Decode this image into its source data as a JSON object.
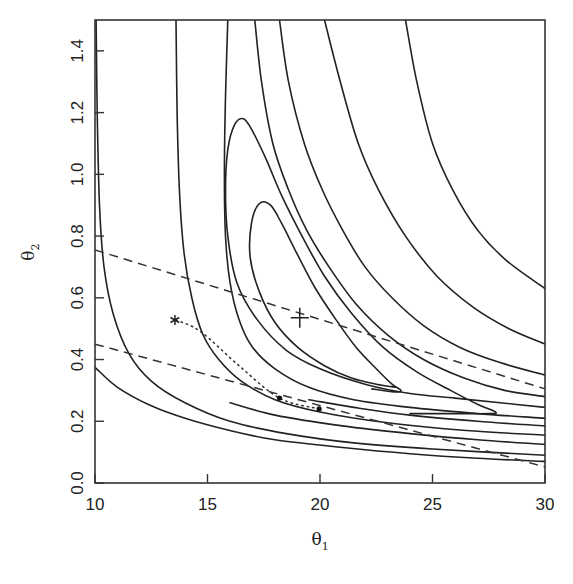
{
  "chart_data": {
    "type": "line",
    "subtype": "contour",
    "title": "",
    "xlabel": "θ",
    "xlabel_sub": "1",
    "ylabel": "θ",
    "ylabel_sub": "2",
    "xlim": [
      10,
      30
    ],
    "ylim": [
      0,
      1.5
    ],
    "xticks": [
      10,
      15,
      20,
      25,
      30
    ],
    "xtick_labels": [
      "10",
      "15",
      "20",
      "25",
      "30"
    ],
    "yticks": [
      0.0,
      0.2,
      0.4,
      0.6,
      0.8,
      1.0,
      1.2,
      1.4
    ],
    "ytick_labels": [
      "0.0",
      "0.2",
      "0.4",
      "0.6",
      "0.8",
      "1.0",
      "1.2",
      "1.4"
    ],
    "grid": false,
    "legend": "none",
    "contours": [
      {
        "name": "contour-1",
        "points": [
          [
            10.05,
            1.5
          ],
          [
            10.1,
            1.2
          ],
          [
            10.2,
            0.9
          ],
          [
            10.4,
            0.7
          ],
          [
            10.8,
            0.55
          ],
          [
            11.5,
            0.42
          ],
          [
            12.5,
            0.33
          ],
          [
            14,
            0.26
          ],
          [
            16,
            0.2
          ],
          [
            18.5,
            0.16
          ],
          [
            21.5,
            0.13
          ],
          [
            25,
            0.11
          ],
          [
            30,
            0.09
          ]
        ]
      },
      {
        "name": "contour-0",
        "points": [
          [
            10,
            0.375
          ],
          [
            11,
            0.31
          ],
          [
            12.5,
            0.25
          ],
          [
            14,
            0.21
          ],
          [
            16,
            0.17
          ],
          [
            18,
            0.14
          ],
          [
            21,
            0.115
          ],
          [
            24,
            0.095
          ],
          [
            27,
            0.08
          ],
          [
            30,
            0.07
          ]
        ]
      },
      {
        "name": "contour-2",
        "points": [
          [
            13.6,
            1.5
          ],
          [
            13.65,
            1.2
          ],
          [
            13.75,
            0.95
          ],
          [
            13.95,
            0.75
          ],
          [
            14.3,
            0.6
          ],
          [
            14.8,
            0.48
          ],
          [
            15.5,
            0.4
          ],
          [
            16.5,
            0.33
          ],
          [
            18,
            0.27
          ],
          [
            20,
            0.23
          ],
          [
            23,
            0.195
          ],
          [
            26.5,
            0.17
          ],
          [
            30,
            0.155
          ]
        ]
      },
      {
        "name": "contour-3",
        "points": [
          [
            15.9,
            1.5
          ],
          [
            15.8,
            1.25
          ],
          [
            15.75,
            1.0
          ],
          [
            15.8,
            0.8
          ],
          [
            16.0,
            0.65
          ],
          [
            16.4,
            0.53
          ],
          [
            17.0,
            0.44
          ],
          [
            18,
            0.37
          ],
          [
            19.5,
            0.31
          ],
          [
            21.5,
            0.27
          ],
          [
            24,
            0.245
          ],
          [
            27,
            0.225
          ],
          [
            30,
            0.21
          ]
        ]
      },
      {
        "name": "contour-4",
        "points": [
          [
            20.2,
            1.5
          ],
          [
            20.9,
            1.3
          ],
          [
            21.7,
            1.1
          ],
          [
            22.6,
            0.95
          ],
          [
            23.8,
            0.8
          ],
          [
            25.2,
            0.67
          ],
          [
            26.8,
            0.57
          ],
          [
            28.4,
            0.5
          ],
          [
            30,
            0.45
          ]
        ]
      },
      {
        "name": "contour-5",
        "points": [
          [
            23.8,
            1.5
          ],
          [
            24.3,
            1.3
          ],
          [
            25.0,
            1.1
          ],
          [
            25.9,
            0.95
          ],
          [
            27.0,
            0.82
          ],
          [
            28.3,
            0.72
          ],
          [
            30,
            0.63
          ]
        ]
      },
      {
        "name": "contour-6",
        "points": [
          [
            18.2,
            1.5
          ],
          [
            18.6,
            1.3
          ],
          [
            19.3,
            1.1
          ],
          [
            20.1,
            0.95
          ],
          [
            21.0,
            0.82
          ],
          [
            22.0,
            0.7
          ],
          [
            23.2,
            0.6
          ],
          [
            24.6,
            0.51
          ],
          [
            26.2,
            0.44
          ],
          [
            28,
            0.39
          ],
          [
            30,
            0.35
          ]
        ]
      },
      {
        "name": "contour-7",
        "points": [
          [
            17.1,
            1.5
          ],
          [
            17.4,
            1.3
          ],
          [
            17.9,
            1.1
          ],
          [
            18.6,
            0.95
          ],
          [
            19.4,
            0.82
          ],
          [
            20.4,
            0.7
          ],
          [
            21.6,
            0.58
          ],
          [
            23.0,
            0.48
          ],
          [
            24.6,
            0.4
          ],
          [
            26.4,
            0.34
          ],
          [
            28.2,
            0.3
          ],
          [
            30,
            0.28
          ]
        ]
      },
      {
        "name": "loop-outer",
        "points": [
          [
            30,
            0.245
          ],
          [
            28,
            0.26
          ],
          [
            26,
            0.275
          ],
          [
            24,
            0.29
          ],
          [
            22,
            0.32
          ],
          [
            20,
            0.37
          ],
          [
            18.5,
            0.43
          ],
          [
            17.2,
            0.53
          ],
          [
            16.3,
            0.65
          ],
          [
            15.9,
            0.8
          ],
          [
            15.8,
            0.95
          ],
          [
            15.9,
            1.08
          ],
          [
            16.2,
            1.16
          ],
          [
            16.6,
            1.18
          ],
          [
            17.0,
            1.14
          ],
          [
            17.6,
            1.05
          ],
          [
            18.3,
            0.93
          ],
          [
            19.2,
            0.8
          ],
          [
            20.2,
            0.67
          ],
          [
            21.4,
            0.55
          ],
          [
            22.8,
            0.44
          ],
          [
            24.3,
            0.36
          ],
          [
            25.8,
            0.3
          ],
          [
            27.0,
            0.255
          ],
          [
            27.8,
            0.23
          ],
          [
            27.5,
            0.225
          ],
          [
            26,
            0.225
          ],
          [
            24,
            0.225
          ]
        ]
      },
      {
        "name": "loop-inner",
        "points": [
          [
            23.4,
            0.31
          ],
          [
            22.5,
            0.32
          ],
          [
            21.4,
            0.34
          ],
          [
            20.2,
            0.38
          ],
          [
            19.0,
            0.44
          ],
          [
            18.0,
            0.52
          ],
          [
            17.3,
            0.62
          ],
          [
            16.9,
            0.73
          ],
          [
            16.95,
            0.84
          ],
          [
            17.3,
            0.905
          ],
          [
            17.8,
            0.9
          ],
          [
            18.3,
            0.84
          ],
          [
            19.0,
            0.74
          ],
          [
            19.8,
            0.63
          ],
          [
            20.7,
            0.53
          ],
          [
            21.6,
            0.44
          ],
          [
            22.5,
            0.37
          ],
          [
            23.2,
            0.32
          ],
          [
            23.6,
            0.3
          ],
          [
            23.3,
            0.295
          ],
          [
            22.3,
            0.305
          ]
        ]
      },
      {
        "name": "contour-low-a",
        "points": [
          [
            30,
            0.185
          ],
          [
            27,
            0.2
          ],
          [
            24,
            0.22
          ],
          [
            21.5,
            0.245
          ],
          [
            19.5,
            0.27
          ]
        ]
      },
      {
        "name": "contour-low-b",
        "points": [
          [
            30,
            0.125
          ],
          [
            27,
            0.14
          ],
          [
            24,
            0.16
          ],
          [
            21,
            0.185
          ],
          [
            18,
            0.22
          ],
          [
            16,
            0.26
          ]
        ]
      }
    ],
    "dashed_lines": [
      {
        "name": "upper-dashed-line",
        "points": [
          [
            10,
            0.755
          ],
          [
            30,
            0.305
          ]
        ]
      },
      {
        "name": "lower-dashed-line",
        "points": [
          [
            10,
            0.45
          ],
          [
            30,
            0.052
          ]
        ]
      }
    ],
    "dotted_path": {
      "name": "dotted-path",
      "points": [
        [
          13.6,
          0.528
        ],
        [
          14.7,
          0.49
        ],
        [
          16.4,
          0.38
        ],
        [
          18.2,
          0.275
        ],
        [
          19.96,
          0.24
        ]
      ]
    },
    "markers": [
      {
        "name": "asterisk-marker",
        "symbol": "*",
        "x": 13.55,
        "y": 0.528
      },
      {
        "name": "plus-marker",
        "symbol": "+",
        "x": 19.1,
        "y": 0.535
      },
      {
        "name": "dot-marker-1",
        "symbol": "•",
        "x": 18.2,
        "y": 0.275
      },
      {
        "name": "dot-marker-2",
        "symbol": "•",
        "x": 19.96,
        "y": 0.24
      }
    ]
  }
}
